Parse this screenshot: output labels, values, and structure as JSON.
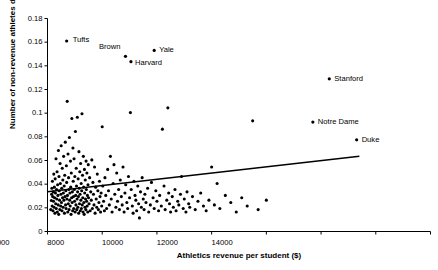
{
  "chart_data": {
    "type": "scatter",
    "title": "",
    "xlabel": "Athletics revenue per student ($)",
    "ylabel": "Number of non-revenue athletes divided by enrollment",
    "xlim": [
      0,
      14000
    ],
    "ylim": [
      0,
      0.18
    ],
    "xticks": [
      0,
      2000,
      4000,
      6000,
      8000,
      10000,
      12000,
      14000
    ],
    "xtick_labels": [
      "0",
      "2000",
      "4000",
      "6000",
      "8000",
      "10000",
      "12000",
      "14000"
    ],
    "yticks": [
      0,
      0.02,
      0.04,
      0.06,
      0.08,
      0.1,
      0.12,
      0.14,
      0.16,
      0.18
    ],
    "ytick_labels": [
      "0",
      "0.02",
      "0.04",
      "0.06",
      "0.08",
      "0.1",
      "0.12",
      "0.14",
      "0.16",
      "0.18"
    ],
    "grid": false,
    "legend": false,
    "marker_color": "#000000",
    "axis_color": "#000000",
    "trendline": {
      "type": "line",
      "color": "#000000",
      "x_start": 0,
      "y_start": 0.0335,
      "x_end": 11400,
      "y_end": 0.0635
    },
    "annotations": [
      {
        "label": "Tufts",
        "x": 700,
        "y": 0.161,
        "label_dx": 6,
        "label_dy": -1
      },
      {
        "label": "Brown",
        "x": 2850,
        "y": 0.148,
        "label_dx": -9,
        "label_dy": -9
      },
      {
        "label": "Harvard",
        "x": 3050,
        "y": 0.1435,
        "label_dx": 4,
        "label_dy": 1
      },
      {
        "label": "Yale",
        "x": 3900,
        "y": 0.153,
        "label_dx": 5,
        "label_dy": 0
      },
      {
        "label": "Stanford",
        "x": 10300,
        "y": 0.129,
        "label_dx": 5,
        "label_dy": 0
      },
      {
        "label": "Notre Dame",
        "x": 9700,
        "y": 0.0925,
        "label_dx": 5,
        "label_dy": 0
      },
      {
        "label": "Duke",
        "x": 11300,
        "y": 0.0775,
        "label_dx": 5,
        "label_dy": 0
      }
    ],
    "points": [
      [
        120,
        0.0185
      ],
      [
        140,
        0.0262
      ],
      [
        150,
        0.0315
      ],
      [
        160,
        0.0365
      ],
      [
        170,
        0.0215
      ],
      [
        180,
        0.0425
      ],
      [
        190,
        0.0295
      ],
      [
        200,
        0.0175
      ],
      [
        210,
        0.0335
      ],
      [
        220,
        0.0255
      ],
      [
        230,
        0.0485
      ],
      [
        240,
        0.0205
      ],
      [
        250,
        0.0375
      ],
      [
        260,
        0.0285
      ],
      [
        270,
        0.0155
      ],
      [
        280,
        0.0445
      ],
      [
        290,
        0.0325
      ],
      [
        300,
        0.0235
      ],
      [
        310,
        0.0615
      ],
      [
        320,
        0.0195
      ],
      [
        330,
        0.0355
      ],
      [
        340,
        0.0275
      ],
      [
        350,
        0.0505
      ],
      [
        360,
        0.0165
      ],
      [
        370,
        0.0395
      ],
      [
        380,
        0.0305
      ],
      [
        390,
        0.0225
      ],
      [
        400,
        0.0685
      ],
      [
        410,
        0.0145
      ],
      [
        420,
        0.0465
      ],
      [
        430,
        0.0345
      ],
      [
        440,
        0.0265
      ],
      [
        450,
        0.0185
      ],
      [
        460,
        0.0575
      ],
      [
        470,
        0.0405
      ],
      [
        480,
        0.0215
      ],
      [
        490,
        0.0315
      ],
      [
        500,
        0.0725
      ],
      [
        510,
        0.0245
      ],
      [
        520,
        0.0365
      ],
      [
        530,
        0.0175
      ],
      [
        540,
        0.0535
      ],
      [
        550,
        0.0285
      ],
      [
        560,
        0.0435
      ],
      [
        570,
        0.0205
      ],
      [
        580,
        0.0325
      ],
      [
        590,
        0.0635
      ],
      [
        600,
        0.0265
      ],
      [
        610,
        0.0385
      ],
      [
        620,
        0.0155
      ],
      [
        630,
        0.0475
      ],
      [
        640,
        0.0295
      ],
      [
        650,
        0.0755
      ],
      [
        660,
        0.0225
      ],
      [
        670,
        0.0345
      ],
      [
        680,
        0.0195
      ],
      [
        690,
        0.0555
      ],
      [
        700,
        0.0415
      ],
      [
        710,
        0.0275
      ],
      [
        720,
        0.11
      ],
      [
        730,
        0.0305
      ],
      [
        740,
        0.0165
      ],
      [
        750,
        0.0655
      ],
      [
        760,
        0.0235
      ],
      [
        770,
        0.0455
      ],
      [
        780,
        0.0355
      ],
      [
        790,
        0.0185
      ],
      [
        800,
        0.0795
      ],
      [
        810,
        0.0265
      ],
      [
        820,
        0.0325
      ],
      [
        830,
        0.0215
      ],
      [
        840,
        0.0595
      ],
      [
        850,
        0.0375
      ],
      [
        860,
        0.0145
      ],
      [
        870,
        0.0495
      ],
      [
        880,
        0.0285
      ],
      [
        890,
        0.0955
      ],
      [
        900,
        0.0245
      ],
      [
        910,
        0.0335
      ],
      [
        920,
        0.0175
      ],
      [
        930,
        0.0705
      ],
      [
        940,
        0.0425
      ],
      [
        950,
        0.0295
      ],
      [
        960,
        0.0195
      ],
      [
        970,
        0.0615
      ],
      [
        980,
        0.0355
      ],
      [
        990,
        0.0255
      ],
      [
        1000,
        0.0465
      ],
      [
        1010,
        0.0165
      ],
      [
        1020,
        0.0845
      ],
      [
        1030,
        0.0305
      ],
      [
        1040,
        0.0225
      ],
      [
        1050,
        0.0535
      ],
      [
        1060,
        0.0385
      ],
      [
        1070,
        0.0185
      ],
      [
        1080,
        0.0275
      ],
      [
        1090,
        0.0965
      ],
      [
        1100,
        0.0335
      ],
      [
        1110,
        0.0205
      ],
      [
        1120,
        0.0445
      ],
      [
        1130,
        0.0295
      ],
      [
        1140,
        0.0155
      ],
      [
        1150,
        0.0675
      ],
      [
        1160,
        0.0365
      ],
      [
        1170,
        0.0235
      ],
      [
        1180,
        0.0505
      ],
      [
        1190,
        0.0315
      ],
      [
        1200,
        0.0175
      ],
      [
        1210,
        0.0575
      ],
      [
        1220,
        0.0265
      ],
      [
        1230,
        0.0405
      ],
      [
        1240,
        0.0195
      ],
      [
        1250,
        0.0345
      ],
      [
        1260,
        0.0995
      ],
      [
        1270,
        0.0225
      ],
      [
        1280,
        0.0475
      ],
      [
        1290,
        0.0285
      ],
      [
        1300,
        0.0165
      ],
      [
        1310,
        0.0635
      ],
      [
        1320,
        0.0375
      ],
      [
        1330,
        0.0245
      ],
      [
        1340,
        0.0145
      ],
      [
        1350,
        0.0525
      ],
      [
        1360,
        0.0325
      ],
      [
        1370,
        0.0205
      ],
      [
        1380,
        0.0435
      ],
      [
        1390,
        0.0275
      ],
      [
        1400,
        0.0185
      ],
      [
        1410,
        0.0595
      ],
      [
        1420,
        0.0355
      ],
      [
        1430,
        0.0255
      ],
      [
        1440,
        0.0495
      ],
      [
        1450,
        0.0215
      ],
      [
        1460,
        0.0305
      ],
      [
        1470,
        0.0165
      ],
      [
        1480,
        0.0395
      ],
      [
        1490,
        0.0565
      ],
      [
        1500,
        0.0285
      ],
      [
        1520,
        0.0235
      ],
      [
        1540,
        0.0455
      ],
      [
        1560,
        0.0175
      ],
      [
        1580,
        0.0335
      ],
      [
        1600,
        0.0265
      ],
      [
        1620,
        0.0605
      ],
      [
        1640,
        0.0195
      ],
      [
        1660,
        0.0415
      ],
      [
        1680,
        0.0315
      ],
      [
        1700,
        0.0225
      ],
      [
        1720,
        0.0545
      ],
      [
        1740,
        0.0155
      ],
      [
        1760,
        0.0375
      ],
      [
        1780,
        0.0275
      ],
      [
        1800,
        0.0205
      ],
      [
        1820,
        0.0485
      ],
      [
        1840,
        0.0345
      ],
      [
        1860,
        0.0185
      ],
      [
        1880,
        0.0245
      ],
      [
        1900,
        0.0425
      ],
      [
        1920,
        0.0295
      ],
      [
        1940,
        0.0165
      ],
      [
        1960,
        0.0325
      ],
      [
        1980,
        0.0215
      ],
      [
        2000,
        0.0885
      ],
      [
        2020,
        0.0385
      ],
      [
        2050,
        0.0255
      ],
      [
        2080,
        0.0175
      ],
      [
        2100,
        0.0455
      ],
      [
        2130,
        0.0305
      ],
      [
        2160,
        0.0195
      ],
      [
        2200,
        0.0525
      ],
      [
        2230,
        0.0345
      ],
      [
        2260,
        0.0225
      ],
      [
        2300,
        0.0635
      ],
      [
        2330,
        0.0275
      ],
      [
        2360,
        0.0165
      ],
      [
        2400,
        0.0405
      ],
      [
        2430,
        0.0565
      ],
      [
        2460,
        0.0315
      ],
      [
        2500,
        0.0205
      ],
      [
        2530,
        0.0495
      ],
      [
        2560,
        0.0255
      ],
      [
        2600,
        0.0355
      ],
      [
        2630,
        0.0185
      ],
      [
        2660,
        0.0435
      ],
      [
        2700,
        0.0295
      ],
      [
        2730,
        0.0225
      ],
      [
        2760,
        0.0545
      ],
      [
        2800,
        0.0165
      ],
      [
        2830,
        0.0325
      ],
      [
        2860,
        0.0395
      ],
      [
        2900,
        0.0245
      ],
      [
        2930,
        0.0195
      ],
      [
        2960,
        0.0465
      ],
      [
        3000,
        0.0285
      ],
      [
        3030,
        0.1005
      ],
      [
        3060,
        0.0355
      ],
      [
        3100,
        0.0215
      ],
      [
        3130,
        0.0155
      ],
      [
        3160,
        0.0425
      ],
      [
        3200,
        0.0305
      ],
      [
        3230,
        0.0265
      ],
      [
        3260,
        0.0175
      ],
      [
        3300,
        0.0385
      ],
      [
        3330,
        0.0235
      ],
      [
        3360,
        0.0115
      ],
      [
        3400,
        0.0335
      ],
      [
        3430,
        0.0205
      ],
      [
        3460,
        0.0455
      ],
      [
        3500,
        0.0275
      ],
      [
        3530,
        0.0185
      ],
      [
        3560,
        0.0315
      ],
      [
        3600,
        0.0245
      ],
      [
        3660,
        0.0365
      ],
      [
        3700,
        0.0165
      ],
      [
        3760,
        0.0225
      ],
      [
        3800,
        0.0415
      ],
      [
        3860,
        0.0285
      ],
      [
        3900,
        0.0195
      ],
      [
        3960,
        0.0345
      ],
      [
        4000,
        0.0255
      ],
      [
        4060,
        0.0175
      ],
      [
        4100,
        0.0305
      ],
      [
        4160,
        0.0215
      ],
      [
        4200,
        0.0865
      ],
      [
        4260,
        0.0385
      ],
      [
        4300,
        0.0185
      ],
      [
        4360,
        0.0265
      ],
      [
        4400,
        0.1045
      ],
      [
        4430,
        0.0325
      ],
      [
        4460,
        0.0235
      ],
      [
        4500,
        0.0165
      ],
      [
        4560,
        0.0295
      ],
      [
        4600,
        0.0205
      ],
      [
        4660,
        0.0355
      ],
      [
        4700,
        0.0175
      ],
      [
        4760,
        0.0255
      ],
      [
        4800,
        0.0225
      ],
      [
        4860,
        0.0315
      ],
      [
        4900,
        0.0465
      ],
      [
        4960,
        0.0195
      ],
      [
        5000,
        0.0275
      ],
      [
        5060,
        0.0165
      ],
      [
        5100,
        0.0335
      ],
      [
        5160,
        0.0235
      ],
      [
        5200,
        0.0205
      ],
      [
        5300,
        0.0295
      ],
      [
        5400,
        0.0185
      ],
      [
        5500,
        0.0255
      ],
      [
        5600,
        0.0325
      ],
      [
        5700,
        0.0215
      ],
      [
        5800,
        0.0175
      ],
      [
        5900,
        0.0265
      ],
      [
        6000,
        0.0545
      ],
      [
        6100,
        0.0225
      ],
      [
        6200,
        0.0405
      ],
      [
        6300,
        0.0195
      ],
      [
        6500,
        0.0305
      ],
      [
        6700,
        0.0245
      ],
      [
        6900,
        0.0165
      ],
      [
        7100,
        0.0285
      ],
      [
        7300,
        0.0215
      ],
      [
        7500,
        0.0935
      ],
      [
        7700,
        0.0185
      ],
      [
        8000,
        0.0265
      ]
    ]
  }
}
